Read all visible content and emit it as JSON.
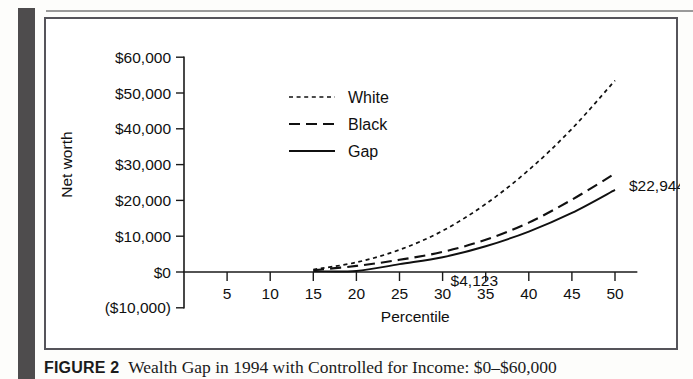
{
  "figure": {
    "caption_label": "FIGURE 2",
    "caption_text": "Wealth Gap in 1994 with Controlled for Income: $0–$60,000"
  },
  "chart_data": {
    "type": "line",
    "title": "",
    "xlabel": "Percentile",
    "ylabel": "Net worth",
    "xlim": [
      0,
      52.5
    ],
    "ylim": [
      -10000,
      60000
    ],
    "grid": false,
    "legend_position": "upper-center",
    "xticks": [
      5,
      10,
      15,
      20,
      25,
      30,
      35,
      40,
      45,
      50
    ],
    "xtick_labels": [
      "5",
      "10",
      "15",
      "20",
      "25",
      "30",
      "35",
      "40",
      "45",
      "50"
    ],
    "yticks": [
      -10000,
      0,
      10000,
      20000,
      30000,
      40000,
      50000,
      60000
    ],
    "ytick_labels": [
      "($10,000)",
      "$0",
      "$10,000",
      "$20,000",
      "$30,000",
      "$40,000",
      "$50,000",
      "$60,000"
    ],
    "x": [
      15,
      20,
      25,
      30,
      35,
      40,
      45,
      50
    ],
    "series": [
      {
        "name": "White",
        "style": "dotted",
        "values": [
          700,
          2700,
          6200,
          11500,
          19000,
          28500,
          40000,
          53500
        ]
      },
      {
        "name": "Black",
        "style": "dashed",
        "values": [
          500,
          1700,
          3400,
          5600,
          9000,
          13800,
          20200,
          27500
        ]
      },
      {
        "name": "Gap",
        "style": "solid",
        "values": [
          200,
          300,
          2200,
          4123,
          7200,
          11300,
          16500,
          22944
        ]
      }
    ],
    "annotations": [
      {
        "text": "$4,123",
        "x": 30,
        "y": 4123
      },
      {
        "text": "$22,944",
        "x": 50,
        "y": 22944
      }
    ]
  }
}
